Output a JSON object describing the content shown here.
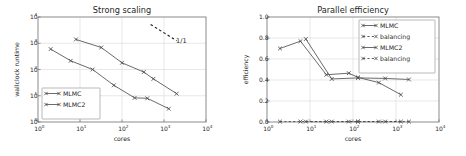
{
  "figure": {
    "width": 466,
    "height": 156,
    "background": "#ffffff",
    "axis_color": "#6e6e6e",
    "grid_color": "#d9d9d9",
    "line_color": "#5a5a5a",
    "text_color": "#1f1f1f"
  },
  "chart_data": [
    {
      "type": "line",
      "id": "strong-scaling",
      "title": "Strong scaling",
      "xlabel": "cores",
      "ylabel": "wallclock runtime",
      "xscale": "log",
      "yscale": "log",
      "xlim": [
        1,
        10000
      ],
      "ylim": [
        1,
        10000
      ],
      "grid": true,
      "xticks": [
        1,
        10,
        100,
        1000,
        10000
      ],
      "xticklabels": [
        "10^0",
        "10^1",
        "10^2",
        "10^3",
        "10^4"
      ],
      "xtick_bases": [
        "10",
        "10",
        "10",
        "10",
        "10"
      ],
      "xtick_exps": [
        "0",
        "1",
        "2",
        "3",
        "4"
      ],
      "yticks": [
        1,
        10,
        100,
        1000,
        10000
      ],
      "yticklabels": [
        "10^0",
        "10^1",
        "10^2",
        "10^3",
        "10^4"
      ],
      "ytick_bases": [
        "10",
        "10",
        "10",
        "10",
        "10"
      ],
      "ytick_exps": [
        "0",
        "1",
        "2",
        "3",
        "4"
      ],
      "legend_position": "lower left",
      "series": [
        {
          "name": "MLMC",
          "marker": "x",
          "linestyle": "solid",
          "x": [
            2,
            6,
            20,
            64,
            200,
            400,
            1300
          ],
          "y": [
            600,
            215,
            100,
            25,
            8.3,
            8.0,
            3.2
          ]
        },
        {
          "name": "MLMC2",
          "marker": "x",
          "linestyle": "solid",
          "x": [
            8,
            32,
            100,
            330,
            560,
            2000
          ],
          "y": [
            1400,
            690,
            180,
            80,
            44,
            12
          ]
        }
      ],
      "annotations": [
        {
          "text": "1/1",
          "x": 2600,
          "y": 1050,
          "reference_line": {
            "x": [
              480,
              2000
            ],
            "y": [
              5200,
              1250
            ],
            "linestyle": "dashed"
          }
        }
      ]
    },
    {
      "type": "line",
      "id": "parallel-efficiency",
      "title": "Parallel efficiency",
      "xlabel": "cores",
      "ylabel": "efficiency",
      "xscale": "log",
      "yscale": "linear",
      "xlim": [
        1,
        10000
      ],
      "ylim": [
        0.0,
        1.0
      ],
      "grid": true,
      "xticks": [
        1,
        10,
        100,
        1000,
        10000
      ],
      "xticklabels": [
        "10^0",
        "10^1",
        "10^2",
        "10^3",
        "10^4"
      ],
      "xtick_bases": [
        "10",
        "10",
        "10",
        "10",
        "10"
      ],
      "xtick_exps": [
        "0",
        "1",
        "2",
        "3",
        "4"
      ],
      "yticks": [
        0.0,
        0.2,
        0.4,
        0.6,
        0.8,
        1.0
      ],
      "yticklabels": [
        "0.0",
        "0.2",
        "0.4",
        "0.6",
        "0.8",
        "1.0"
      ],
      "legend_position": "upper right",
      "series": [
        {
          "name": "MLMC",
          "marker": "x",
          "linestyle": "solid",
          "x": [
            2,
            6,
            24,
            80,
            130,
            400,
            1300
          ],
          "y": [
            0.7,
            0.77,
            0.45,
            0.465,
            0.425,
            0.375,
            0.26
          ]
        },
        {
          "name": "balancing",
          "marker": "x",
          "linestyle": "dashed",
          "x": [
            2,
            6,
            24,
            80,
            130,
            400,
            1300
          ],
          "y": [
            0.004,
            0.004,
            0.004,
            0.004,
            0.004,
            0.004,
            0.004
          ]
        },
        {
          "name": "MLMC2",
          "marker": "x",
          "linestyle": "solid",
          "x": [
            8,
            32,
            130,
            560,
            2000
          ],
          "y": [
            0.79,
            0.41,
            0.42,
            0.415,
            0.405
          ]
        },
        {
          "name": "balancing",
          "marker": "x",
          "linestyle": "dashed",
          "x": [
            8,
            32,
            130,
            560,
            2000
          ],
          "y": [
            0.004,
            0.004,
            0.004,
            0.004,
            0.004
          ]
        }
      ]
    }
  ]
}
